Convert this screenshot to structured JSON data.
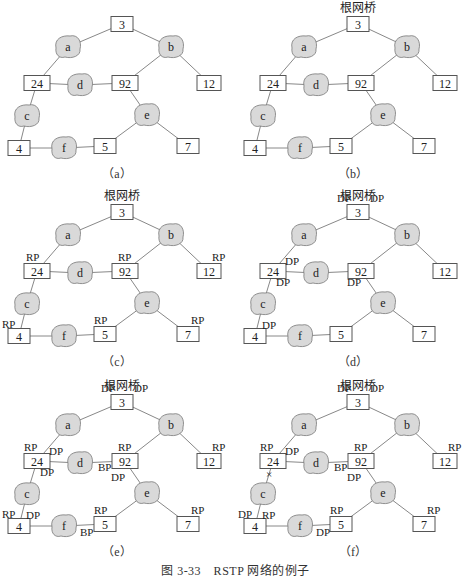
{
  "figure": {
    "caption": "图 3-33　RSTP 网络的例子",
    "root_label": "根网桥",
    "colors": {
      "segment_fill": "#d9d9d9",
      "segment_stroke": "#777777",
      "link": "#888888",
      "box_stroke": "#555555"
    }
  },
  "topology": {
    "bridges": [
      {
        "id": "3",
        "x": 122,
        "y": 24
      },
      {
        "id": "24",
        "x": 37,
        "y": 83
      },
      {
        "id": "92",
        "x": 125,
        "y": 83
      },
      {
        "id": "12",
        "x": 209,
        "y": 83
      },
      {
        "id": "4",
        "x": 19,
        "y": 148
      },
      {
        "id": "5",
        "x": 105,
        "y": 146
      },
      {
        "id": "7",
        "x": 188,
        "y": 146
      }
    ],
    "segments": [
      {
        "id": "a",
        "x": 68,
        "y": 47
      },
      {
        "id": "b",
        "x": 171,
        "y": 47
      },
      {
        "id": "c",
        "x": 27,
        "y": 116
      },
      {
        "id": "d",
        "x": 80,
        "y": 85
      },
      {
        "id": "e",
        "x": 147,
        "y": 115
      },
      {
        "id": "f",
        "x": 64,
        "y": 148
      }
    ],
    "links": [
      [
        "3",
        "a"
      ],
      [
        "a",
        "24"
      ],
      [
        "3",
        "b"
      ],
      [
        "b",
        "92"
      ],
      [
        "b",
        "12"
      ],
      [
        "24",
        "d"
      ],
      [
        "d",
        "92"
      ],
      [
        "24",
        "c"
      ],
      [
        "c",
        "4"
      ],
      [
        "92",
        "e"
      ],
      [
        "e",
        "5"
      ],
      [
        "e",
        "7"
      ],
      [
        "4",
        "f"
      ],
      [
        "f",
        "5"
      ]
    ]
  },
  "panels": [
    {
      "label": "（a）",
      "x": 0,
      "y": 0,
      "show_root": false,
      "ports": []
    },
    {
      "label": "（b）",
      "x": 236,
      "y": 0,
      "show_root": true,
      "ports": []
    },
    {
      "label": "（c）",
      "x": 0,
      "y": 188,
      "show_root": true,
      "ports": [
        {
          "text": "RP",
          "dx": -11,
          "dy": -10,
          "node": "24"
        },
        {
          "text": "RP",
          "dx": -7,
          "dy": -10,
          "node": "92"
        },
        {
          "text": "RP",
          "dx": 3,
          "dy": -10,
          "node": "12"
        },
        {
          "text": "RP",
          "dx": -17,
          "dy": -8,
          "node": "4"
        },
        {
          "text": "RP",
          "dx": -11,
          "dy": -10,
          "node": "5"
        },
        {
          "text": "RP",
          "dx": 3,
          "dy": -10,
          "node": "7"
        }
      ]
    },
    {
      "label": "（d）",
      "x": 236,
      "y": 188,
      "show_root": true,
      "ports": [
        {
          "text": "DP",
          "dx": -21,
          "dy": -10,
          "node": "3"
        },
        {
          "text": "DP",
          "dx": 12,
          "dy": -10,
          "node": "3"
        },
        {
          "text": "DP",
          "dx": 12,
          "dy": -6,
          "node": "24"
        },
        {
          "text": "DP",
          "dx": 3,
          "dy": 15,
          "node": "24"
        },
        {
          "text": "DP",
          "dx": -14,
          "dy": 15,
          "node": "92"
        },
        {
          "text": "DP",
          "dx": 7,
          "dy": -7,
          "node": "4"
        }
      ]
    },
    {
      "label": "（e）",
      "x": 0,
      "y": 378,
      "show_root": true,
      "ports": [
        {
          "text": "DP",
          "dx": -21,
          "dy": -10,
          "node": "3"
        },
        {
          "text": "DP",
          "dx": 12,
          "dy": -10,
          "node": "3"
        },
        {
          "text": "RP",
          "dx": -13,
          "dy": -10,
          "node": "24"
        },
        {
          "text": "DP",
          "dx": 12,
          "dy": -6,
          "node": "24"
        },
        {
          "text": "DP",
          "dx": 3,
          "dy": 15,
          "node": "24"
        },
        {
          "text": "RP",
          "dx": -7,
          "dy": -10,
          "node": "92"
        },
        {
          "text": "BP",
          "dx": -27,
          "dy": 10,
          "node": "92"
        },
        {
          "text": "DP",
          "dx": -14,
          "dy": 20,
          "node": "92"
        },
        {
          "text": "RP",
          "dx": 3,
          "dy": -10,
          "node": "12"
        },
        {
          "text": "RP",
          "dx": -17,
          "dy": -8,
          "node": "4"
        },
        {
          "text": "DP",
          "dx": 7,
          "dy": -7,
          "node": "4"
        },
        {
          "text": "RP",
          "dx": -11,
          "dy": -10,
          "node": "5"
        },
        {
          "text": "BP",
          "dx": -25,
          "dy": 12,
          "node": "5"
        },
        {
          "text": "RP",
          "dx": 3,
          "dy": -10,
          "node": "7"
        }
      ]
    },
    {
      "label": "（f）",
      "x": 236,
      "y": 378,
      "show_root": true,
      "ports": [
        {
          "text": "DP",
          "dx": -21,
          "dy": -10,
          "node": "3"
        },
        {
          "text": "DP",
          "dx": 12,
          "dy": -10,
          "node": "3"
        },
        {
          "text": "RP",
          "dx": -13,
          "dy": -10,
          "node": "24"
        },
        {
          "text": "DP",
          "dx": 12,
          "dy": -6,
          "node": "24"
        },
        {
          "text": "×",
          "dx": -7,
          "dy": 17,
          "node": "24"
        },
        {
          "text": "RP",
          "dx": -7,
          "dy": -10,
          "node": "92"
        },
        {
          "text": "BP",
          "dx": -27,
          "dy": 10,
          "node": "92"
        },
        {
          "text": "DP",
          "dx": -14,
          "dy": 20,
          "node": "92"
        },
        {
          "text": "RP",
          "dx": 3,
          "dy": -10,
          "node": "12"
        },
        {
          "text": "DP",
          "dx": -17,
          "dy": -8,
          "node": "4"
        },
        {
          "text": "RP",
          "dx": 7,
          "dy": -7,
          "node": "4"
        },
        {
          "text": "RP",
          "dx": -11,
          "dy": -10,
          "node": "5"
        },
        {
          "text": "DP",
          "dx": -25,
          "dy": 12,
          "node": "5"
        },
        {
          "text": "RP",
          "dx": 3,
          "dy": -10,
          "node": "7"
        }
      ]
    }
  ]
}
